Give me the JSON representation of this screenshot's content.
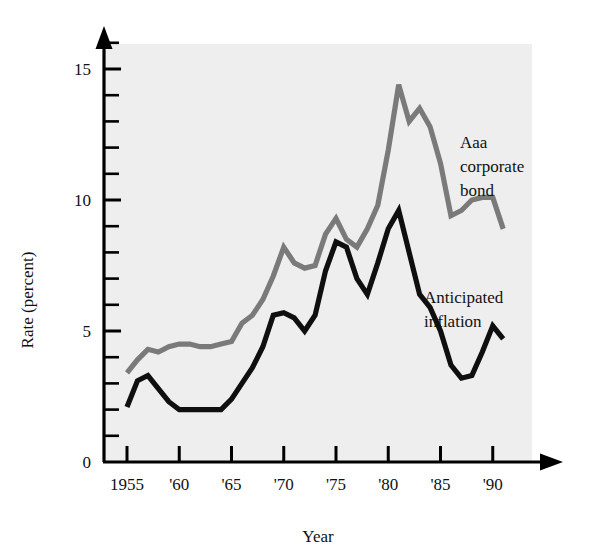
{
  "chart_data": {
    "type": "line",
    "title": "",
    "xlabel": "Year",
    "ylabel": "Rate (percent)",
    "xlim": [
      1954,
      1992.5
    ],
    "ylim": [
      0,
      16.6
    ],
    "grid": false,
    "legend_position": "inline-annotation",
    "y_ticks_major": [
      0,
      5,
      10,
      15
    ],
    "y_tick_labels": [
      "0",
      "5",
      "10",
      "15"
    ],
    "y_ticks_minor": [
      1,
      2,
      3,
      4,
      6,
      7,
      8,
      9,
      11,
      12,
      13,
      14,
      16
    ],
    "x_ticks": [
      1955,
      1960,
      1965,
      1970,
      1975,
      1980,
      1985,
      1990
    ],
    "x_tick_labels": [
      "1955",
      "'60",
      "'65",
      "'70",
      "'75",
      "'80",
      "'85",
      "'90"
    ],
    "x": [
      1955,
      1956,
      1957,
      1958,
      1959,
      1960,
      1961,
      1962,
      1963,
      1964,
      1965,
      1966,
      1967,
      1968,
      1969,
      1970,
      1971,
      1972,
      1973,
      1974,
      1975,
      1976,
      1977,
      1978,
      1979,
      1980,
      1981,
      1982,
      1983,
      1984,
      1985,
      1986,
      1987,
      1988,
      1989,
      1990,
      1991
    ],
    "series": [
      {
        "name": "Aaa corporate bond",
        "color": "#7a7a7a",
        "label_lines": [
          "Aaa",
          "corporate",
          "bond"
        ],
        "values": [
          3.4,
          3.9,
          4.3,
          4.2,
          4.4,
          4.5,
          4.5,
          4.4,
          4.4,
          4.5,
          4.6,
          5.3,
          5.6,
          6.2,
          7.1,
          8.2,
          7.6,
          7.4,
          7.5,
          8.7,
          9.3,
          8.5,
          8.2,
          8.9,
          9.8,
          11.9,
          14.4,
          13.0,
          13.5,
          12.8,
          11.4,
          9.4,
          9.6,
          10.0,
          10.1,
          10.1,
          8.9
        ]
      },
      {
        "name": "Anticipated inflation",
        "color": "#0f0f0f",
        "label_lines": [
          "Anticipated",
          "inflation"
        ],
        "values": [
          2.1,
          3.1,
          3.3,
          2.8,
          2.3,
          2.0,
          2.0,
          2.0,
          2.0,
          2.0,
          2.4,
          3.0,
          3.6,
          4.4,
          5.6,
          5.7,
          5.5,
          5.0,
          5.6,
          7.3,
          8.4,
          8.2,
          7.0,
          6.4,
          7.6,
          8.9,
          9.6,
          8.0,
          6.4,
          5.9,
          5.0,
          3.7,
          3.2,
          3.3,
          4.2,
          5.2,
          4.7
        ]
      }
    ]
  },
  "axis": {
    "y_title": "Rate (percent)",
    "x_title": "Year"
  }
}
